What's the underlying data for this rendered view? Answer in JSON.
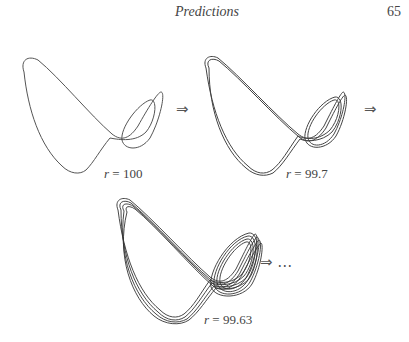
{
  "header": {
    "title": "Predictions",
    "page_number": "65"
  },
  "figures": [
    {
      "label_var": "r",
      "label_eq": " = 100",
      "arrow": "⇒"
    },
    {
      "label_var": "r",
      "label_eq": " = 99.7",
      "arrow": "⇒"
    },
    {
      "label_var": "r",
      "label_eq": " = 99.63",
      "arrow": "⇒ …"
    }
  ],
  "colors": {
    "ink": "#444444",
    "background": "#ffffff"
  }
}
